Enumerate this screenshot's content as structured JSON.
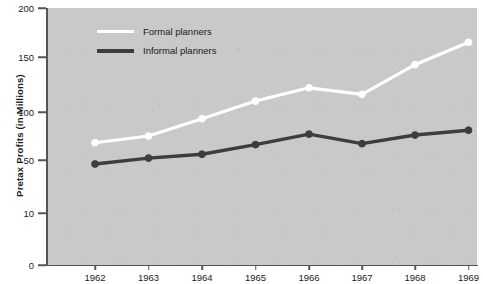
{
  "chart_data": {
    "type": "line",
    "title": "",
    "xlabel": "",
    "ylabel": "Pretax Profits (in Millions)",
    "categories": [
      "1962",
      "1963",
      "1964",
      "1965",
      "1966",
      "1967",
      "1968",
      "1969"
    ],
    "x": [
      1962,
      1963,
      1964,
      1965,
      1966,
      1967,
      1968,
      1969
    ],
    "series": [
      {
        "name": "Formal planners",
        "color": "#ffffff",
        "marker": "circle-open-white",
        "values": [
          68,
          75,
          93,
          110,
          122,
          116,
          143,
          165
        ]
      },
      {
        "name": "Informal planners",
        "color": "#3d3d3d",
        "marker": "circle-filled-dark",
        "values": [
          47,
          52,
          56,
          66,
          77,
          67,
          76,
          81
        ]
      }
    ],
    "ylim": [
      0,
      200
    ],
    "y_ticks": [
      0,
      10,
      50,
      100,
      150,
      200
    ],
    "y_tick_labels": [
      "0",
      "10",
      "50",
      "100",
      "150",
      "200"
    ],
    "y_tick_spacing": "non-linear",
    "grid": false,
    "legend_position": "top-left-inside",
    "plot_background": "#c9c9c9",
    "axis_color": "#555555"
  },
  "axes": {
    "y_title": "Pretax Profits (in Millions)",
    "y_ticks": [
      {
        "label": "200",
        "value": 200
      },
      {
        "label": "150",
        "value": 150
      },
      {
        "label": "100",
        "value": 100
      },
      {
        "label": "50",
        "value": 50
      },
      {
        "label": "10",
        "value": 10
      },
      {
        "label": "0",
        "value": 0
      }
    ],
    "x_ticks": [
      {
        "label": "1962"
      },
      {
        "label": "1963"
      },
      {
        "label": "1964"
      },
      {
        "label": "1965"
      },
      {
        "label": "1966"
      },
      {
        "label": "1967"
      },
      {
        "label": "1968"
      },
      {
        "label": "1969"
      }
    ]
  },
  "legend": {
    "items": [
      {
        "label": "Formal planners",
        "color": "#ffffff"
      },
      {
        "label": "Informal planners",
        "color": "#3d3d3d"
      }
    ]
  }
}
